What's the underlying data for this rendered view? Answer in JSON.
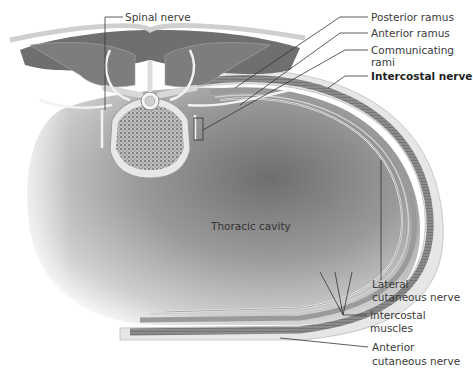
{
  "figure": {
    "type": "anatomical cross-section"
  },
  "labels": {
    "spinal_nerve": "Spinal nerve",
    "posterior_ramus": "Posterior ramus",
    "anterior_ramus": "Anterior ramus",
    "communicating_rami_line1": "Communicating",
    "communicating_rami_line2": "rami",
    "intercostal_nerve": "Intercostal nerve",
    "thoracic_cavity": "Thoracic cavity",
    "lateral_cutaneous_line1": "Lateral",
    "lateral_cutaneous_line2": "cutaneous nerve",
    "intercostal_muscles_line1": "Intercostal",
    "intercostal_muscles_line2": "muscles",
    "anterior_cutaneous_line1": "Anterior",
    "anterior_cutaneous_line2": "cutaneous nerve"
  },
  "colors": {
    "cavity_dark": "#8a8a8a",
    "cavity_light": "#d8d8d8",
    "tissue": "#e4e4e4",
    "muscle": "#7a7a7a",
    "leader_line": "#333333",
    "text": "#3a3a3a"
  }
}
